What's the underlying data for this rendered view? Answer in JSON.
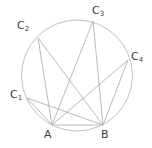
{
  "figure": {
    "background_color": "#ffffff",
    "stroke_color": "#a8a8a8",
    "circle_stroke_color": "#b0b0b0",
    "label_color": "#3a3a3a",
    "stroke_width": 0.8,
    "circle": {
      "cx": 77,
      "cy": 75.5,
      "r": 55.5
    },
    "points": [
      {
        "id": "A",
        "label": "A",
        "sub": "",
        "x": 52,
        "y": 125,
        "label_x": 44,
        "label_y": 129
      },
      {
        "id": "B",
        "label": "B",
        "sub": "",
        "x": 103,
        "y": 125,
        "label_x": 101,
        "label_y": 129
      },
      {
        "id": "C1",
        "label": "C",
        "sub": "1",
        "x": 27,
        "y": 98,
        "label_x": 10,
        "label_y": 89
      },
      {
        "id": "C2",
        "label": "C",
        "sub": "2",
        "x": 38,
        "y": 38,
        "label_x": 17,
        "label_y": 20
      },
      {
        "id": "C3",
        "label": "C",
        "sub": "3",
        "x": 93,
        "y": 21,
        "label_x": 92,
        "label_y": 5
      },
      {
        "id": "C4",
        "label": "C",
        "sub": "4",
        "x": 128,
        "y": 60,
        "label_x": 131,
        "label_y": 51
      }
    ],
    "chords": [
      {
        "from": "A",
        "to": "B"
      },
      {
        "from": "A",
        "to": "C1"
      },
      {
        "from": "A",
        "to": "C2"
      },
      {
        "from": "A",
        "to": "C3"
      },
      {
        "from": "A",
        "to": "C4"
      },
      {
        "from": "B",
        "to": "C1"
      },
      {
        "from": "B",
        "to": "C2"
      },
      {
        "from": "B",
        "to": "C3"
      },
      {
        "from": "B",
        "to": "C4"
      }
    ]
  }
}
